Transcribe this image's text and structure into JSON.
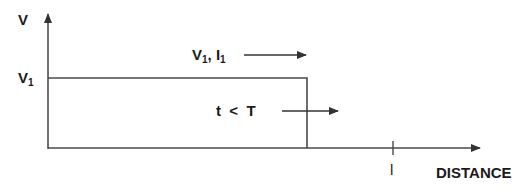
{
  "diagram": {
    "y_axis_label": "V",
    "x_axis_label": "DISTANCE",
    "level_label": {
      "main": "V",
      "sub": "1"
    },
    "wave_label": {
      "v": "V",
      "v_sub": "1",
      "sep": ", ",
      "i": "I",
      "i_sub": "1"
    },
    "time_label": "t  <  T",
    "length_tick_label": "l"
  },
  "colors": {
    "line": "#4a4a4a",
    "text": "#1a1a1a",
    "background": "#ffffff"
  }
}
